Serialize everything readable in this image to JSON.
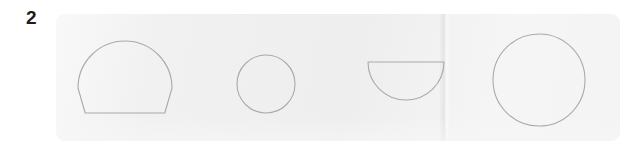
{
  "figure": {
    "label": "2",
    "panel_background": "#f1f1f1",
    "page_background": "#ffffff",
    "stroke_color": "#aaaaaa",
    "label_color": "#1c1c1c",
    "panel": {
      "x": 56,
      "y": 14,
      "width": 564,
      "height": 127,
      "corner_radius": 9
    }
  },
  "shapes": [
    {
      "name": "dome",
      "description": "circle with flat bottom (dome / arch outline)",
      "cx": 125,
      "cy": 88,
      "radius": 47,
      "flat_bottom_y": 113,
      "bounds": {
        "left": 78,
        "top": 42,
        "right": 172,
        "bottom": 113
      }
    },
    {
      "name": "circle-small",
      "description": "small circle outline",
      "cx": 266,
      "cy": 84,
      "rx": 29,
      "ry": 29,
      "bounds": {
        "left": 237,
        "top": 55,
        "right": 295,
        "bottom": 113
      }
    },
    {
      "name": "semicircle",
      "description": "half disc with flat top (bowl)",
      "cx": 406,
      "cy": 62,
      "radius": 38,
      "flat_top_y": 62,
      "bounds": {
        "left": 368,
        "top": 62,
        "right": 444,
        "bottom": 100
      }
    },
    {
      "name": "circle-large",
      "description": "large circle outline",
      "cx": 539,
      "cy": 80,
      "rx": 46,
      "ry": 46,
      "bounds": {
        "left": 493,
        "top": 34,
        "right": 585,
        "bottom": 126
      }
    }
  ]
}
